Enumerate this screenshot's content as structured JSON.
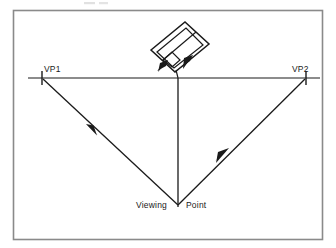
{
  "figure": {
    "kind": "two-point-perspective-construction-diagram",
    "background_color": "#ffffff",
    "ink_color": "#1a1a1a",
    "frame": {
      "color": "#8a8a8a",
      "x": 13,
      "y": 10,
      "width": 310,
      "height": 230
    },
    "canvas": {
      "width": 336,
      "height": 248
    }
  },
  "labels": {
    "vp1": "VP1",
    "vp2": "VP2",
    "viewing_left": "Viewing",
    "viewing_right": "Point"
  },
  "geometry": {
    "horizon": {
      "x1": 28,
      "y1": 78,
      "x2": 320,
      "y2": 78
    },
    "vp1_point": {
      "x": 42,
      "y": 78
    },
    "vp2_point": {
      "x": 306,
      "y": 78
    },
    "viewing_point": {
      "x": 178,
      "y": 205
    },
    "vertical_axis": {
      "x": 178,
      "y_top": 78,
      "y_bottom": 205
    },
    "sight_line_left": {
      "x1": 178,
      "y1": 205,
      "x2": 42,
      "y2": 78
    },
    "sight_line_right": {
      "x1": 178,
      "y1": 205,
      "x2": 306,
      "y2": 78
    },
    "box_corner_near": {
      "x": 178,
      "y": 72
    }
  },
  "box": {
    "description": "rotated rectangular block above horizon",
    "outer_polygon": [
      {
        "x": 151,
        "y": 50
      },
      {
        "x": 185,
        "y": 22
      },
      {
        "x": 209,
        "y": 44
      },
      {
        "x": 175,
        "y": 72
      }
    ],
    "inner_polygon": [
      {
        "x": 157,
        "y": 52
      },
      {
        "x": 186,
        "y": 28
      },
      {
        "x": 203,
        "y": 45
      },
      {
        "x": 174,
        "y": 68
      }
    ],
    "ridge_line": {
      "x1": 164,
      "y1": 59,
      "x2": 196,
      "y2": 33
    },
    "step_line": {
      "x1": 164,
      "y1": 59,
      "x2": 180,
      "y2": 73
    }
  },
  "arrows": [
    {
      "name": "arrow-to-vp1-midspan",
      "x": 92,
      "y": 129,
      "direction": "up-left"
    },
    {
      "name": "arrow-to-vp2-midspan",
      "x": 220,
      "y": 156,
      "direction": "up-right"
    },
    {
      "name": "arrow-box-lower-left",
      "x": 160,
      "y": 68,
      "direction": "down-left"
    },
    {
      "name": "arrow-box-lower-right",
      "x": 186,
      "y": 62,
      "direction": "up-right"
    }
  ]
}
